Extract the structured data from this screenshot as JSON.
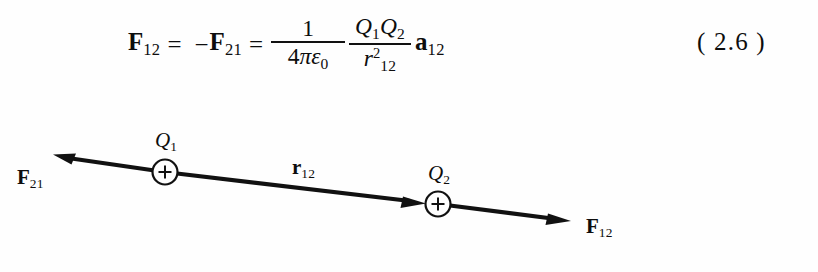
{
  "page": {
    "background_color": "#fefefe",
    "ink_color": "#0d0d0d"
  },
  "equation": {
    "number": "( 2.6 )",
    "plain_text": "F12 = -F21 = (1 / (4*pi*epsilon_0)) * (Q1*Q2 / r12^2) * a12",
    "lhs": {
      "symbol": "F",
      "subscript": "12"
    },
    "equals_1": "=",
    "minus": "−",
    "rhs_negated": {
      "symbol": "F",
      "subscript": "21"
    },
    "equals_2": "=",
    "fraction_1": {
      "numerator": "1",
      "denominator_coefficient": "4",
      "denominator_pi": "π",
      "denominator_epsilon": "ε",
      "denominator_epsilon_subscript": "0"
    },
    "fraction_2": {
      "numerator_q1": "Q",
      "numerator_q1_subscript": "1",
      "numerator_q2": "Q",
      "numerator_q2_subscript": "2",
      "denominator_r": "r",
      "denominator_subscript": "12",
      "denominator_exponent": "2"
    },
    "unit_vector": {
      "symbol": "a",
      "subscript": "12"
    }
  },
  "diagram": {
    "line_color": "#111111",
    "charges": [
      {
        "id": "q1",
        "label_symbol": "Q",
        "label_subscript": "1",
        "sign_glyph": "+",
        "cx": 165,
        "cy": 172,
        "r": 12
      },
      {
        "id": "q2",
        "label_symbol": "Q",
        "label_subscript": "2",
        "sign_glyph": "+",
        "cx": 438,
        "cy": 204,
        "r": 12
      }
    ],
    "vectors": [
      {
        "id": "f21",
        "label_symbol": "F",
        "label_subscript": "21",
        "direction": "left",
        "tip_x": 55,
        "tip_y": 155,
        "tail_x": 165,
        "tail_y": 172
      },
      {
        "id": "r12",
        "label_symbol": "r",
        "label_subscript": "12",
        "direction": "right",
        "tip_x": 424,
        "tip_y": 203,
        "tail_x": 177,
        "tail_y": 173
      },
      {
        "id": "f12",
        "label_symbol": "F",
        "label_subscript": "12",
        "direction": "right",
        "tip_x": 570,
        "tip_y": 221,
        "tail_x": 450,
        "tail_y": 206
      }
    ]
  }
}
